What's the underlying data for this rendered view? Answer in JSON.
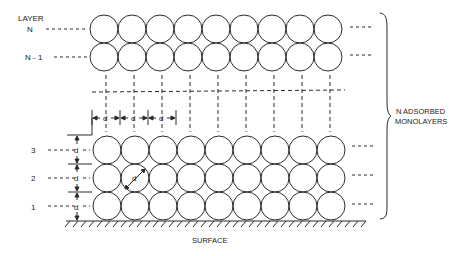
{
  "diagram": {
    "type": "adsorbed monolayers schematic",
    "header_label": "LAYER",
    "top_layers": [
      {
        "label": "N"
      },
      {
        "label": "N - 1"
      }
    ],
    "bottom_layers": [
      {
        "label": "3"
      },
      {
        "label": "2"
      },
      {
        "label": "1"
      }
    ],
    "dimension_symbol": "d",
    "brace_label_line1": "N ADSORBED",
    "brace_label_line2": "MONOLAYERS",
    "surface_label": "SURFACE",
    "circles_per_row": 9,
    "line_color": "#2a2a2a"
  }
}
